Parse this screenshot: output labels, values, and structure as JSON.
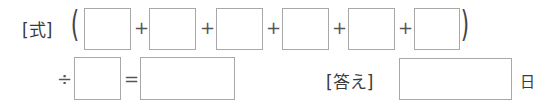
{
  "formula": {
    "label": "[式]",
    "open_paren": "(",
    "close_paren": ")",
    "plus": "+",
    "divide": "÷",
    "equals": "=",
    "addend_boxes": [
      "",
      "",
      "",
      "",
      "",
      ""
    ],
    "divisor_box": "",
    "result_box": ""
  },
  "answer": {
    "label": "[答え]",
    "value": "",
    "unit": "日"
  }
}
